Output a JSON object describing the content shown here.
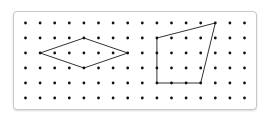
{
  "grid": {
    "columns": 16,
    "rows": 6,
    "origin_x": 25.5,
    "origin_y": 23,
    "spacing_x": 14.6,
    "spacing_y": 15,
    "dot_color": "#111111",
    "line_color": "#333333"
  },
  "shapes": [
    {
      "name": "kite-shape",
      "vertices": [
        [
          1,
          2
        ],
        [
          4,
          1
        ],
        [
          7,
          2
        ],
        [
          4,
          3
        ]
      ]
    },
    {
      "name": "quadrilateral-shape",
      "vertices": [
        [
          9,
          1
        ],
        [
          13,
          0
        ],
        [
          12,
          4
        ],
        [
          9,
          4
        ]
      ]
    }
  ]
}
